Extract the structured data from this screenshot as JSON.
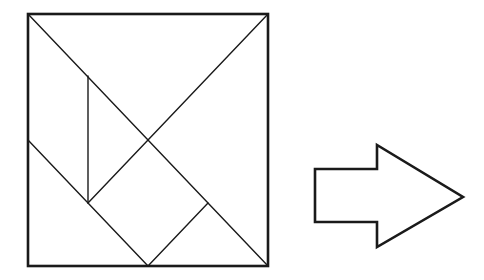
{
  "diagram": {
    "stroke_color": "#1a1a1a",
    "background": "#ffffff",
    "square": {
      "x": 28,
      "y": 14,
      "width": 240,
      "height": 252,
      "border_width": 2.6
    },
    "inner_lines": [
      {
        "name": "main-diagonal-tl-br",
        "x1": 28,
        "y1": 14,
        "x2": 268,
        "y2": 266
      },
      {
        "name": "diagonal-tr-center",
        "x1": 268,
        "y1": 14,
        "x2": 148,
        "y2": 140
      },
      {
        "name": "center-to-left-square-corner",
        "x1": 148,
        "y1": 140,
        "x2": 88,
        "y2": 203
      },
      {
        "name": "vertical-segment",
        "x1": 88,
        "y1": 76,
        "x2": 88,
        "y2": 203
      },
      {
        "name": "left-diagonal",
        "x1": 28,
        "y1": 140,
        "x2": 148,
        "y2": 266
      },
      {
        "name": "small-square-right-edge",
        "x1": 208,
        "y1": 203,
        "x2": 148,
        "y2": 266
      }
    ],
    "line_width": 1.4,
    "arrow": {
      "direction": "right",
      "points": [
        [
          315,
          169
        ],
        [
          377,
          169
        ],
        [
          377,
          145
        ],
        [
          463,
          197
        ],
        [
          377,
          247
        ],
        [
          377,
          222
        ],
        [
          315,
          222
        ]
      ],
      "stroke_width": 2.6,
      "fill": "#ffffff"
    }
  }
}
